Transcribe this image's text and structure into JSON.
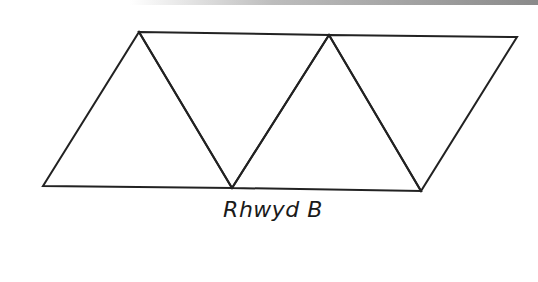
{
  "diagram": {
    "caption": "Rhwyd B",
    "line_color": "#222222",
    "triangle_count": 4
  }
}
